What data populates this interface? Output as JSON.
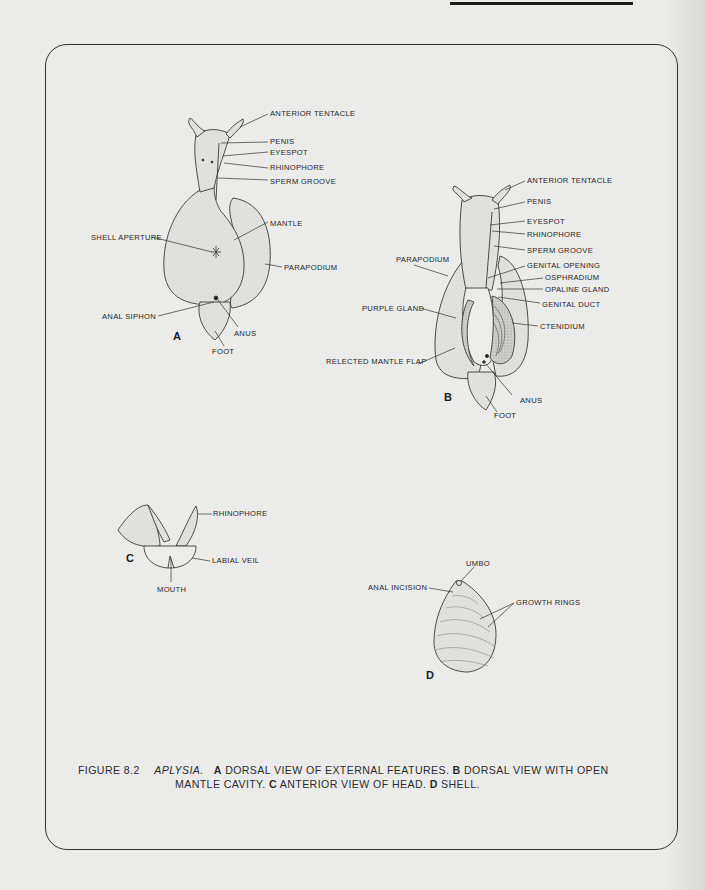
{
  "figure": {
    "number": "FIGURE 8.2",
    "genus": "APLYSIA.",
    "caption_parts": {
      "a_letter": "A",
      "a_text": "DORSAL VIEW OF EXTERNAL FEATURES.",
      "b_letter": "B",
      "b_text_line1": "DORSAL VIEW WITH OPEN",
      "b_text_line2": "MANTLE CAVITY.",
      "c_letter": "C",
      "c_text": "ANTERIOR VIEW OF HEAD.",
      "d_letter": "D",
      "d_text": "SHELL."
    }
  },
  "panels": {
    "A": {
      "letter": "A",
      "labels": {
        "anterior_tentacle": "ANTERIOR TENTACLE",
        "penis": "PENIS",
        "eyespot": "EYESPOT",
        "rhinophore": "RHINOPHORE",
        "sperm_groove": "SPERM GROOVE",
        "mantle": "MANTLE",
        "shell_aperture": "SHELL APERTURE",
        "parapodium": "PARAPODIUM",
        "anal_siphon": "ANAL SIPHON",
        "anus": "ANUS",
        "foot": "FOOT"
      }
    },
    "B": {
      "letter": "B",
      "labels": {
        "anterior_tentacle": "ANTERIOR TENTACLE",
        "penis": "PENIS",
        "eyespot": "EYESPOT",
        "rhinophore": "RHINOPHORE",
        "sperm_groove": "SPERM GROOVE",
        "parapodium": "PARAPODIUM",
        "genital_opening": "GENITAL OPENING",
        "osphradium": "OSPHRADIUM",
        "opaline_gland": "OPALINE GLAND",
        "genital_duct": "GENITAL DUCT",
        "purple_gland": "PURPLE GLAND",
        "ctenidium": "CTENIDIUM",
        "relected_mantle_flap": "RELECTED MANTLE FLAP",
        "anus": "ANUS",
        "foot": "FOOT"
      }
    },
    "C": {
      "letter": "C",
      "labels": {
        "rhinophore": "RHINOPHORE",
        "labial_veil": "LABIAL VEIL",
        "mouth": "MOUTH"
      }
    },
    "D": {
      "letter": "D",
      "labels": {
        "umbo": "UMBO",
        "anal_incision": "ANAL INCISION",
        "growth_rings": "GROWTH RINGS"
      }
    }
  }
}
